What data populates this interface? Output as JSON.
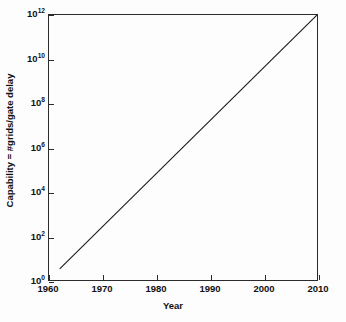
{
  "chart_data": {
    "type": "line",
    "title": "",
    "xlabel": "Year",
    "ylabel": "Capability = #grids/gate delay",
    "xlim": [
      1960,
      2010
    ],
    "ylim": [
      1,
      1000000000000
    ],
    "yscale": "log",
    "grid": false,
    "legend": null,
    "xticks": [
      1960,
      1970,
      1980,
      1990,
      2000,
      2010
    ],
    "xticklabels": [
      "1960",
      "1970",
      "1980",
      "1990",
      "2000",
      "2010"
    ],
    "yticks": [
      1,
      100,
      10000,
      1000000,
      100000000,
      10000000000,
      1000000000000
    ],
    "yticklabels": [
      {
        "base": "10",
        "exp": "0"
      },
      {
        "base": "10",
        "exp": "2"
      },
      {
        "base": "10",
        "exp": "4"
      },
      {
        "base": "10",
        "exp": "6"
      },
      {
        "base": "10",
        "exp": "8"
      },
      {
        "base": "10",
        "exp": "10"
      },
      {
        "base": "10",
        "exp": "12"
      }
    ],
    "series": [
      {
        "name": "capability",
        "color": "#1a1a1a",
        "linewidth": 1.1,
        "x": [
          1962,
          2010
        ],
        "y": [
          3.2,
          1000000000000
        ]
      }
    ]
  },
  "figure": {
    "background": "#fdfdfd",
    "frame_color": "#2b2b2b"
  }
}
